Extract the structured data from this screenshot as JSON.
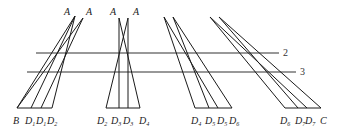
{
  "diagram": {
    "horizontal_lines": [
      {
        "label": "2",
        "x1": 36,
        "x2": 279,
        "y": 53
      },
      {
        "label": "3",
        "x1": 27,
        "x2": 296,
        "y": 72
      }
    ],
    "groups": [
      {
        "apex_labels": [
          {
            "text": "A",
            "x": 64,
            "y": 16
          },
          {
            "text": "A",
            "x": 87,
            "y": 16
          }
        ],
        "base_labels": [
          {
            "main": "B",
            "sub": "",
            "x": 13
          },
          {
            "main": "D",
            "sub": "1",
            "x": 26
          },
          {
            "main": "D",
            "sub": "1",
            "x": 36
          },
          {
            "main": "D",
            "sub": "2",
            "x": 47
          }
        ]
      },
      {
        "apex_labels": [
          {
            "text": "A",
            "x": 110,
            "y": 16
          },
          {
            "text": "A",
            "x": 133,
            "y": 16
          }
        ],
        "base_labels": [
          {
            "main": "D",
            "sub": "2",
            "x": 97
          },
          {
            "main": "D",
            "sub": "3",
            "x": 111
          },
          {
            "main": "D",
            "sub": "3",
            "x": 123
          },
          {
            "main": "D",
            "sub": "4",
            "x": 142
          }
        ]
      },
      {
        "apex_labels": [],
        "base_labels": [
          {
            "main": "D",
            "sub": "4",
            "x": 191
          },
          {
            "main": "D",
            "sub": "5",
            "x": 205
          },
          {
            "main": "D",
            "sub": "5",
            "x": 217
          },
          {
            "main": "D",
            "sub": "6",
            "x": 231
          }
        ]
      },
      {
        "apex_labels": [],
        "base_labels": [
          {
            "main": "D",
            "sub": "6",
            "x": 280
          },
          {
            "main": "D",
            "sub": "7",
            "x": 296
          },
          {
            "main": "D",
            "sub": "7",
            "x": 306
          },
          {
            "main": "C",
            "sub": "",
            "x": 322
          }
        ]
      }
    ]
  }
}
